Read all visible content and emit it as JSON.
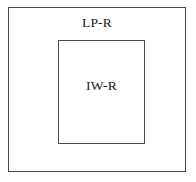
{
  "diagram": {
    "type": "nested-rectangles",
    "background_color": "#ffffff",
    "border_color": "#4a4a4a",
    "text_color": "#1a1a1a",
    "regions": [
      {
        "id": "outer",
        "label": "LP-R",
        "label_position": "top-center",
        "x": 8,
        "y": 7,
        "width": 178,
        "height": 165
      },
      {
        "id": "inner",
        "label": "IW-R",
        "label_position": "upper-center",
        "x": 57,
        "y": 39,
        "width": 87,
        "height": 104
      }
    ]
  }
}
